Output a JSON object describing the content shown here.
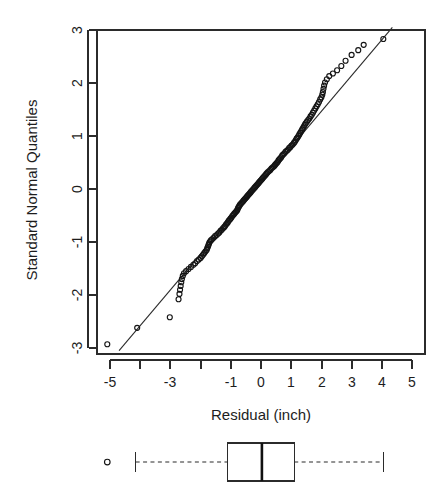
{
  "chart_data": [
    {
      "type": "scatter",
      "name": "normal-qq-plot",
      "title": "",
      "xlabel": "Residual (inch)",
      "ylabel": "Standard Normal Quantiles",
      "xlim": [
        -5.3,
        5.3
      ],
      "ylim": [
        -3.15,
        3.15
      ],
      "grid": false,
      "legend": "none",
      "x_ticks": [
        -5,
        -4,
        -3,
        -2,
        -1,
        0,
        1,
        2,
        3,
        4,
        5
      ],
      "x_tick_labels": [
        "-5",
        "",
        "-3",
        "",
        "-1",
        "0",
        "1",
        "2",
        "3",
        "4",
        "5"
      ],
      "y_ticks": [
        -3,
        -2,
        -1,
        0,
        1,
        2,
        3
      ],
      "y_tick_labels": [
        "-3",
        "-2",
        "-1",
        "0",
        "1",
        "2",
        "3"
      ],
      "reference_line": {
        "label": "qq-reference-line",
        "x_start": -4.7,
        "y_start": -3.05,
        "x_end": 4.35,
        "y_end": 3.05
      },
      "marker": "open-circle",
      "points": [
        [
          -5.09,
          -2.93
        ],
        [
          -4.1,
          -2.62
        ],
        [
          -3.02,
          -2.42
        ],
        [
          -2.73,
          -2.08
        ],
        [
          -2.7,
          -1.98
        ],
        [
          -2.68,
          -1.9
        ],
        [
          -2.66,
          -1.83
        ],
        [
          -2.64,
          -1.76
        ],
        [
          -2.62,
          -1.7
        ],
        [
          -2.59,
          -1.64
        ],
        [
          -2.55,
          -1.59
        ],
        [
          -2.48,
          -1.55
        ],
        [
          -2.4,
          -1.51
        ],
        [
          -2.32,
          -1.47
        ],
        [
          -2.24,
          -1.43
        ],
        [
          -2.18,
          -1.4
        ],
        [
          -2.12,
          -1.36
        ],
        [
          -2.06,
          -1.33
        ],
        [
          -2.0,
          -1.3
        ],
        [
          -1.96,
          -1.27
        ],
        [
          -1.92,
          -1.24
        ],
        [
          -1.88,
          -1.21
        ],
        [
          -1.84,
          -1.18
        ],
        [
          -1.8,
          -1.15
        ],
        [
          -1.78,
          -1.12
        ],
        [
          -1.76,
          -1.09
        ],
        [
          -1.74,
          -1.06
        ],
        [
          -1.72,
          -1.03
        ],
        [
          -1.7,
          -1.0
        ],
        [
          -1.66,
          -0.97
        ],
        [
          -1.62,
          -0.95
        ],
        [
          -1.57,
          -0.92
        ],
        [
          -1.52,
          -0.89
        ],
        [
          -1.47,
          -0.87
        ],
        [
          -1.42,
          -0.84
        ],
        [
          -1.38,
          -0.82
        ],
        [
          -1.34,
          -0.79
        ],
        [
          -1.3,
          -0.77
        ],
        [
          -1.26,
          -0.74
        ],
        [
          -1.22,
          -0.72
        ],
        [
          -1.19,
          -0.7
        ],
        [
          -1.16,
          -0.67
        ],
        [
          -1.13,
          -0.65
        ],
        [
          -1.1,
          -0.63
        ],
        [
          -1.07,
          -0.6
        ],
        [
          -1.04,
          -0.58
        ],
        [
          -1.01,
          -0.56
        ],
        [
          -0.98,
          -0.54
        ],
        [
          -0.95,
          -0.51
        ],
        [
          -0.92,
          -0.49
        ],
        [
          -0.89,
          -0.47
        ],
        [
          -0.86,
          -0.45
        ],
        [
          -0.83,
          -0.43
        ],
        [
          -0.8,
          -0.41
        ],
        [
          -0.78,
          -0.39
        ],
        [
          -0.76,
          -0.36
        ],
        [
          -0.74,
          -0.34
        ],
        [
          -0.72,
          -0.32
        ],
        [
          -0.7,
          -0.3
        ],
        [
          -0.67,
          -0.28
        ],
        [
          -0.64,
          -0.26
        ],
        [
          -0.61,
          -0.24
        ],
        [
          -0.58,
          -0.22
        ],
        [
          -0.55,
          -0.2
        ],
        [
          -0.52,
          -0.18
        ],
        [
          -0.49,
          -0.16
        ],
        [
          -0.46,
          -0.14
        ],
        [
          -0.43,
          -0.12
        ],
        [
          -0.4,
          -0.1
        ],
        [
          -0.37,
          -0.08
        ],
        [
          -0.34,
          -0.06
        ],
        [
          -0.31,
          -0.04
        ],
        [
          -0.28,
          -0.02
        ],
        [
          -0.25,
          0.0
        ],
        [
          -0.22,
          0.02
        ],
        [
          -0.19,
          0.04
        ],
        [
          -0.16,
          0.06
        ],
        [
          -0.13,
          0.08
        ],
        [
          -0.1,
          0.1
        ],
        [
          -0.07,
          0.12
        ],
        [
          -0.04,
          0.14
        ],
        [
          -0.01,
          0.16
        ],
        [
          0.02,
          0.18
        ],
        [
          0.05,
          0.2
        ],
        [
          0.08,
          0.22
        ],
        [
          0.11,
          0.24
        ],
        [
          0.14,
          0.26
        ],
        [
          0.17,
          0.28
        ],
        [
          0.2,
          0.3
        ],
        [
          0.23,
          0.32
        ],
        [
          0.27,
          0.34
        ],
        [
          0.31,
          0.36
        ],
        [
          0.35,
          0.39
        ],
        [
          0.39,
          0.41
        ],
        [
          0.43,
          0.43
        ],
        [
          0.46,
          0.45
        ],
        [
          0.49,
          0.47
        ],
        [
          0.52,
          0.49
        ],
        [
          0.55,
          0.51
        ],
        [
          0.58,
          0.54
        ],
        [
          0.61,
          0.56
        ],
        [
          0.64,
          0.58
        ],
        [
          0.67,
          0.6
        ],
        [
          0.7,
          0.63
        ],
        [
          0.73,
          0.65
        ],
        [
          0.77,
          0.67
        ],
        [
          0.81,
          0.7
        ],
        [
          0.85,
          0.72
        ],
        [
          0.89,
          0.74
        ],
        [
          0.93,
          0.77
        ],
        [
          0.97,
          0.79
        ],
        [
          1.01,
          0.82
        ],
        [
          1.05,
          0.84
        ],
        [
          1.09,
          0.87
        ],
        [
          1.12,
          0.89
        ],
        [
          1.15,
          0.92
        ],
        [
          1.18,
          0.95
        ],
        [
          1.21,
          0.97
        ],
        [
          1.24,
          1.0
        ],
        [
          1.27,
          1.03
        ],
        [
          1.3,
          1.06
        ],
        [
          1.33,
          1.09
        ],
        [
          1.36,
          1.12
        ],
        [
          1.39,
          1.15
        ],
        [
          1.42,
          1.18
        ],
        [
          1.45,
          1.21
        ],
        [
          1.48,
          1.24
        ],
        [
          1.52,
          1.27
        ],
        [
          1.56,
          1.3
        ],
        [
          1.6,
          1.33
        ],
        [
          1.64,
          1.37
        ],
        [
          1.68,
          1.4
        ],
        [
          1.72,
          1.44
        ],
        [
          1.76,
          1.48
        ],
        [
          1.8,
          1.52
        ],
        [
          1.84,
          1.56
        ],
        [
          1.88,
          1.6
        ],
        [
          1.92,
          1.64
        ],
        [
          1.96,
          1.69
        ],
        [
          2.0,
          1.73
        ],
        [
          2.03,
          1.78
        ],
        [
          2.05,
          1.83
        ],
        [
          2.07,
          1.89
        ],
        [
          2.09,
          1.95
        ],
        [
          2.12,
          2.01
        ],
        [
          2.18,
          2.07
        ],
        [
          2.26,
          2.13
        ],
        [
          2.38,
          2.18
        ],
        [
          2.52,
          2.24
        ],
        [
          2.66,
          2.32
        ],
        [
          2.8,
          2.42
        ],
        [
          3.0,
          2.53
        ],
        [
          3.22,
          2.62
        ],
        [
          3.4,
          2.72
        ],
        [
          4.05,
          2.83
        ]
      ]
    },
    {
      "type": "boxplot",
      "name": "residual-boxplot",
      "orientation": "horizontal",
      "xlabel": "",
      "ylabel": "",
      "xlim": [
        -5.3,
        5.3
      ],
      "whisker_min": -4.15,
      "q1": -1.12,
      "median": 0.03,
      "q3": 1.1,
      "whisker_max": 4.05,
      "outliers": [
        -5.09
      ],
      "marker": "open-circle",
      "whisker_style": "dashed"
    }
  ],
  "figure": {
    "background_color": "#ffffff",
    "foreground_color": "#2b2b2b",
    "point_color": "#141414"
  }
}
